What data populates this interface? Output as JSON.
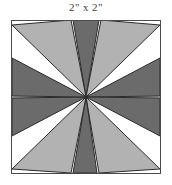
{
  "title": "2\" x 2\"",
  "figure": {
    "name": "eight-pointed-star-quilt-block",
    "background": "#ffffff",
    "frame": {
      "stroke": "#4a4a4a",
      "stroke_width": 1,
      "x": 0,
      "y": 0,
      "width": 150,
      "height": 154
    },
    "grid": {
      "visible": true,
      "stroke": "#b9b9b9",
      "stroke_width": 1,
      "vertical_x": [
        75
      ],
      "horizontal_y": [
        77
      ]
    },
    "center": {
      "x": 75,
      "y": 77
    },
    "colors": {
      "light": "#b2b2b2",
      "dark": "#6b6b6b",
      "outline": "#2b2b2b",
      "background": "#ffffff",
      "grid": "#b9b9b9",
      "frame": "#4a4a4a",
      "title_text": "#3d3d3d"
    },
    "points": [
      {
        "name": "point-n-dark",
        "fill": "dark",
        "tip": [
          62,
          0
        ],
        "left": [
          75,
          77
        ],
        "right": [
          88,
          0
        ]
      },
      {
        "name": "point-ne-light",
        "fill": "light",
        "tip": [
          150,
          6
        ],
        "left": [
          90,
          0
        ],
        "right": [
          75,
          77
        ]
      },
      {
        "name": "point-ne2-dark",
        "fill": "dark",
        "tip": [
          150,
          40
        ],
        "left": [
          75,
          77
        ],
        "right": [
          150,
          77
        ]
      },
      {
        "name": "point-e-dark",
        "fill": "dark",
        "tip": [
          150,
          77
        ],
        "left": [
          75,
          77
        ],
        "right": [
          150,
          114
        ]
      },
      {
        "name": "point-se-light",
        "fill": "light",
        "tip": [
          150,
          148
        ],
        "left": [
          150,
          154
        ],
        "right": [
          75,
          77
        ]
      },
      {
        "name": "point-s-dark",
        "fill": "dark",
        "tip": [
          88,
          154
        ],
        "left": [
          62,
          154
        ],
        "right": [
          75,
          77
        ]
      },
      {
        "name": "point-sw-light",
        "fill": "light",
        "tip": [
          0,
          148
        ],
        "left": [
          75,
          77
        ],
        "right": [
          60,
          154
        ]
      },
      {
        "name": "point-w-dark",
        "fill": "dark",
        "tip": [
          0,
          114
        ],
        "left": [
          0,
          77
        ],
        "right": [
          75,
          77
        ]
      },
      {
        "name": "point-nw-dark",
        "fill": "dark",
        "tip": [
          0,
          40
        ],
        "left": [
          0,
          77
        ],
        "right": [
          75,
          77
        ]
      },
      {
        "name": "point-nw-light",
        "fill": "light",
        "tip": [
          0,
          6
        ],
        "left": [
          75,
          77
        ],
        "right": [
          60,
          0
        ]
      }
    ]
  }
}
